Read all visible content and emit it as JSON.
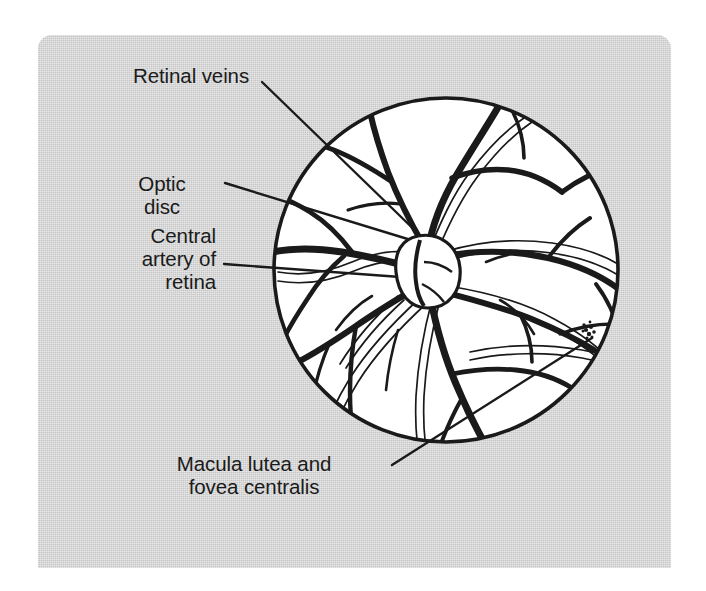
{
  "figure": {
    "background_color": "#c6c6c6",
    "ink_color": "#1a1a1a",
    "field_color": "#ffffff"
  },
  "labels": {
    "retinal_veins": "Retinal veins",
    "optic_disc": "Optic\ndisc",
    "central_artery": "Central\nartery of\nretina",
    "macula": "Macula lutea and\nfovea centralis"
  },
  "structures": [
    {
      "name": "retinal-veins",
      "description": "thick dark branching vessels"
    },
    {
      "name": "optic-disc",
      "description": "oval pale disc where vessels emerge"
    },
    {
      "name": "central-artery-of-retina",
      "description": "thin outlined vessels"
    },
    {
      "name": "macula-lutea-and-fovea-centralis",
      "description": "small stippled spot lateral to disc"
    },
    {
      "name": "fundus-circle",
      "description": "circular ophthalmoscope field of view"
    }
  ]
}
